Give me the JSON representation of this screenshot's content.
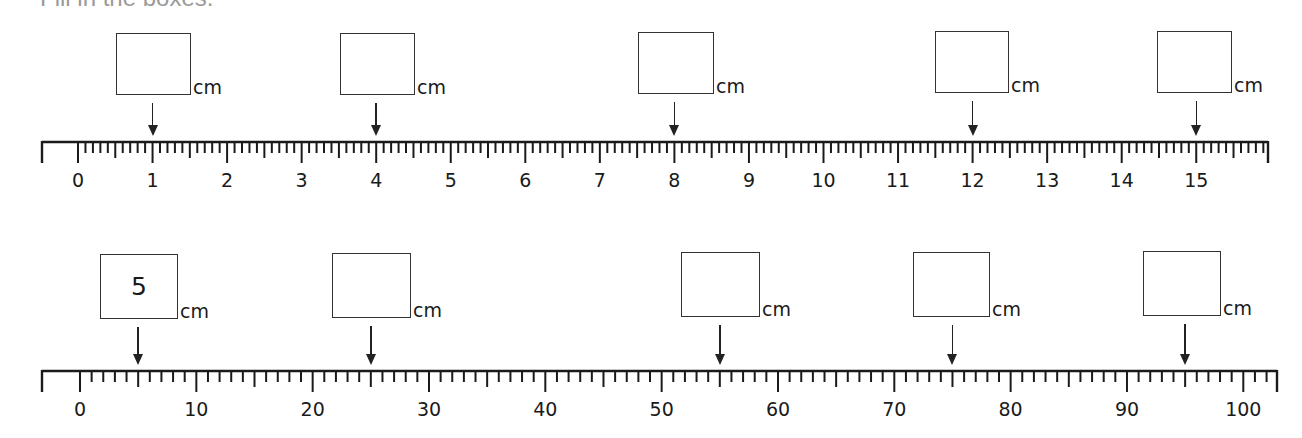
{
  "instruction": "Fill in the boxes.",
  "unit_label": "cm",
  "rulers": [
    {
      "id": "ruler-cm",
      "y": 142,
      "x_start": 42,
      "x_end": 1268,
      "origin_x": 78,
      "px_per_unit": 74.55,
      "labels": [
        "0",
        "1",
        "2",
        "3",
        "4",
        "5",
        "6",
        "7",
        "8",
        "9",
        "10",
        "11",
        "12",
        "13",
        "14",
        "15"
      ],
      "label_values": [
        0,
        1,
        2,
        3,
        4,
        5,
        6,
        7,
        8,
        9,
        10,
        11,
        12,
        13,
        14,
        15
      ],
      "minor_per_label": 10,
      "max_value": 15.9,
      "questions": [
        {
          "target": 1,
          "answer": "",
          "box_x": 116,
          "box_y": 33,
          "box_w": 75,
          "box_h": 62
        },
        {
          "target": 4,
          "answer": "",
          "box_x": 340,
          "box_y": 33,
          "box_w": 75,
          "box_h": 62
        },
        {
          "target": 8,
          "answer": "",
          "box_x": 638,
          "box_y": 32,
          "box_w": 76,
          "box_h": 62
        },
        {
          "target": 12,
          "answer": "",
          "box_x": 935,
          "box_y": 31,
          "box_w": 74,
          "box_h": 62
        },
        {
          "target": 15,
          "answer": "",
          "box_x": 1157,
          "box_y": 31,
          "box_w": 75,
          "box_h": 62
        }
      ]
    },
    {
      "id": "ruler-tens",
      "y": 371,
      "x_start": 42,
      "x_end": 1277,
      "origin_x": 80,
      "px_per_unit": 11.633,
      "labels": [
        "0",
        "10",
        "20",
        "30",
        "40",
        "50",
        "60",
        "70",
        "80",
        "90",
        "100"
      ],
      "label_values": [
        0,
        10,
        20,
        30,
        40,
        50,
        60,
        70,
        80,
        90,
        100
      ],
      "minor_per_label": 10,
      "max_value": 102,
      "questions": [
        {
          "target": 5,
          "answer": "5",
          "box_x": 100,
          "box_y": 254,
          "box_w": 78,
          "box_h": 65
        },
        {
          "target": 25,
          "answer": "",
          "box_x": 332,
          "box_y": 253,
          "box_w": 79,
          "box_h": 65
        },
        {
          "target": 55,
          "answer": "",
          "box_x": 681,
          "box_y": 252,
          "box_w": 79,
          "box_h": 65
        },
        {
          "target": 75,
          "answer": "",
          "box_x": 913,
          "box_y": 252,
          "box_w": 77,
          "box_h": 65
        },
        {
          "target": 95,
          "answer": "",
          "box_x": 1143,
          "box_y": 251,
          "box_w": 78,
          "box_h": 65
        }
      ]
    }
  ]
}
